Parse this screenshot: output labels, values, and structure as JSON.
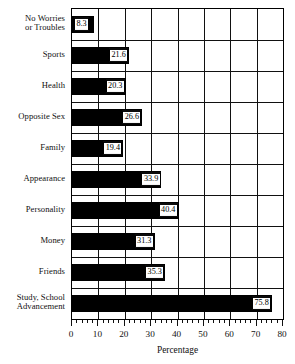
{
  "chart_data": {
    "type": "bar",
    "orientation": "horizontal",
    "title": "",
    "xlabel": "Percentage",
    "ylabel": "",
    "xlim": [
      0,
      80
    ],
    "xticks": [
      0,
      10,
      20,
      30,
      40,
      50,
      60,
      70,
      80
    ],
    "xtick_labels": [
      "0",
      "10",
      "20",
      "30",
      "40",
      "50",
      "60",
      "70",
      "80"
    ],
    "minor_tick_step": 2,
    "grid": "vertical-and-horizontal",
    "legend": "none",
    "bar_color": "#000000",
    "label_box_color": "#ffffff",
    "axis_color": "#111111",
    "categories": [
      "No Worries\nor Troubles",
      "Sports",
      "Health",
      "Opposite Sex",
      "Family",
      "Appearance",
      "Personality",
      "Money",
      "Friends",
      "Study, School\nAdvancement"
    ],
    "category_lines": [
      [
        "No Worries",
        "or Troubles"
      ],
      [
        "Sports"
      ],
      [
        "Health"
      ],
      [
        "Opposite Sex"
      ],
      [
        "Family"
      ],
      [
        "Appearance"
      ],
      [
        "Personality"
      ],
      [
        "Money"
      ],
      [
        "Friends"
      ],
      [
        "Study, School",
        "Advancement"
      ]
    ],
    "values": [
      8.3,
      21.6,
      20.3,
      26.6,
      19.4,
      33.9,
      40.4,
      31.3,
      35.3,
      75.8
    ],
    "value_labels": [
      "8.3",
      "21.6",
      "20.3",
      "26.6",
      "19.4",
      "33.9",
      "40.4",
      "31.3",
      "35.3",
      "75.8"
    ]
  }
}
